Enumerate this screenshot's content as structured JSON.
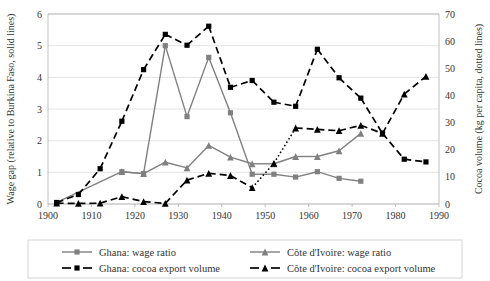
{
  "chart_data": {
    "type": "line",
    "title": "",
    "xlabel": "",
    "ylabel": "Wage gap (relative to Burkina Faso, solid lines)",
    "y2label": "Cocoa volume (kg per capita, dotted lines)",
    "xlim": [
      1900,
      1990
    ],
    "ylim": [
      0,
      6
    ],
    "y2lim": [
      0,
      70
    ],
    "xticks": [
      1900,
      1910,
      1920,
      1930,
      1940,
      1950,
      1960,
      1970,
      1980,
      1990
    ],
    "yticks": [
      0,
      1,
      2,
      3,
      4,
      5,
      6
    ],
    "y2ticks": [
      0,
      10,
      20,
      30,
      40,
      50,
      60,
      70
    ],
    "grid": "horizontal",
    "legend_position": "bottom",
    "series": [
      {
        "name": "Ghana: wage ratio",
        "axis": "left",
        "style": "solid",
        "color": "#808080",
        "marker": "square",
        "x": [
          1902,
          1917,
          1922,
          1927,
          1932,
          1937,
          1942,
          1947,
          1952,
          1957,
          1962,
          1967,
          1972
        ],
        "y": [
          0.05,
          1.02,
          0.96,
          5.0,
          2.76,
          4.63,
          2.88,
          0.94,
          0.94,
          0.85,
          1.02,
          0.81,
          0.72
        ]
      },
      {
        "name": "Côte d'Ivoire: wage ratio",
        "axis": "left",
        "style": "solid",
        "color": "#808080",
        "marker": "triangle",
        "x": [
          1917,
          1922,
          1927,
          1932,
          1937,
          1942,
          1947,
          1952,
          1957,
          1962,
          1967,
          1972
        ],
        "y": [
          1.02,
          0.96,
          1.32,
          1.14,
          1.85,
          1.48,
          1.27,
          1.27,
          1.5,
          1.5,
          1.68,
          2.23
        ]
      },
      {
        "name": "Ghana: cocoa export volume",
        "axis": "right",
        "style": "dashed",
        "color": "#000000",
        "marker": "square",
        "x": [
          1902,
          1907,
          1912,
          1917,
          1922,
          1927,
          1932,
          1937,
          1942,
          1947,
          1952,
          1957,
          1962,
          1967,
          1972,
          1977,
          1982,
          1987
        ],
        "y": [
          0.5,
          3.5,
          13.0,
          30.5,
          49.5,
          62.5,
          58.5,
          65.5,
          43.0,
          45.5,
          37.5,
          36.0,
          57.0,
          46.5,
          39.0,
          26.0,
          16.5,
          15.5
        ]
      },
      {
        "name": "Côte d'Ivoire: cocoa export volume",
        "axis": "right",
        "style": "dashed",
        "color": "#000000",
        "marker": "triangle",
        "x": [
          1902,
          1907,
          1912,
          1917,
          1922,
          1927,
          1932,
          1937,
          1942,
          1947,
          1952,
          1957,
          1962,
          1967,
          1972,
          1977,
          1982,
          1987
        ],
        "y": [
          0.3,
          0.2,
          0.3,
          2.7,
          0.9,
          0.2,
          8.8,
          11.3,
          10.5,
          6.0,
          15.0,
          28.0,
          27.5,
          27.0,
          29.0,
          26.0,
          40.5,
          47.0
        ]
      }
    ],
    "dotted_segment": {
      "series": "Côte d'Ivoire: cocoa export volume",
      "from_x": 1947,
      "to_x": 1957,
      "style": "dotted"
    }
  },
  "axes": {
    "left_title": "Wage gap (relative to Burkina Faso, solid lines)",
    "right_title": "Cocoa volume (kg per capita, dotted lines)",
    "left_ticks": [
      "0",
      "1",
      "2",
      "3",
      "4",
      "5",
      "6"
    ],
    "right_ticks": [
      "0",
      "10",
      "20",
      "30",
      "40",
      "50",
      "60",
      "70"
    ],
    "x_ticks": [
      "1900",
      "1910",
      "1920",
      "1930",
      "1940",
      "1950",
      "1960",
      "1970",
      "1980",
      "1990"
    ]
  },
  "legend": {
    "entries": [
      {
        "label": "Ghana: wage ratio",
        "marker": "square",
        "color": "#808080",
        "style": "solid"
      },
      {
        "label": "Côte d'Ivoire: wage ratio",
        "marker": "triangle",
        "color": "#808080",
        "style": "solid"
      },
      {
        "label": "Ghana: cocoa export volume",
        "marker": "square",
        "color": "#000000",
        "style": "dashed"
      },
      {
        "label": "Côte d'Ivoire: cocoa export volume",
        "marker": "triangle",
        "color": "#000000",
        "style": "dashed"
      }
    ]
  }
}
